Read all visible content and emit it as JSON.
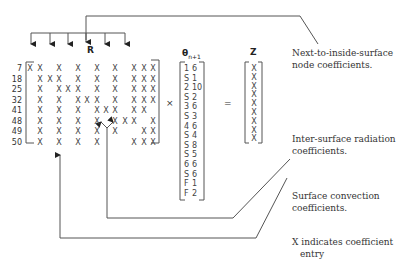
{
  "matrices": {
    "R": {
      "label": "R",
      "row_labels": [
        "7",
        "18",
        "25",
        "32",
        "41",
        "48",
        "49",
        "50"
      ],
      "columns_x": [
        30,
        40,
        50,
        59,
        68,
        78,
        87,
        97,
        106,
        115,
        125,
        134,
        144,
        153
      ],
      "rows": [
        [
          1,
          1,
          0,
          1,
          0,
          1,
          0,
          1,
          0,
          1,
          0,
          1,
          1,
          1
        ],
        [
          0,
          1,
          1,
          1,
          0,
          1,
          0,
          1,
          0,
          1,
          0,
          1,
          1,
          1
        ],
        [
          0,
          1,
          0,
          1,
          1,
          1,
          0,
          1,
          0,
          1,
          0,
          1,
          1,
          1
        ],
        [
          0,
          1,
          0,
          1,
          0,
          1,
          1,
          1,
          0,
          1,
          0,
          1,
          1,
          1
        ],
        [
          0,
          1,
          0,
          1,
          0,
          1,
          0,
          1,
          1,
          1,
          0,
          1,
          1,
          0
        ],
        [
          0,
          1,
          0,
          1,
          0,
          1,
          0,
          1,
          0,
          1,
          1,
          1,
          0,
          1
        ],
        [
          0,
          1,
          0,
          1,
          0,
          1,
          0,
          1,
          0,
          1,
          0,
          0,
          1,
          1
        ],
        [
          0,
          1,
          0,
          1,
          0,
          1,
          0,
          1,
          0,
          0,
          0,
          1,
          1,
          1
        ]
      ],
      "entry_glyph": "X"
    },
    "theta": {
      "label": "θ",
      "subscript": "n+1",
      "rows": [
        [
          "1",
          "6"
        ],
        [
          "S",
          "1"
        ],
        [
          "2",
          "10"
        ],
        [
          "S",
          "2"
        ],
        [
          "3",
          "6"
        ],
        [
          "S",
          "3"
        ],
        [
          "4",
          "6"
        ],
        [
          "S",
          "4"
        ],
        [
          "S",
          "8"
        ],
        [
          "S",
          "5"
        ],
        [
          "6",
          "6"
        ],
        [
          "S",
          "6"
        ],
        [
          "F",
          "1"
        ],
        [
          "F",
          "2"
        ]
      ]
    },
    "Z": {
      "label": "Z",
      "rows": [
        "X",
        "X",
        "X",
        "X",
        "X",
        "X",
        "X",
        "X",
        "X"
      ]
    }
  },
  "operators": {
    "multiply": "×",
    "equals": "="
  },
  "annotations": {
    "next_to_inside": [
      "Next-to-inside-surface",
      "node coefficients."
    ],
    "inter_surface": [
      "Inter-surface radiation",
      "coefficients."
    ],
    "surface_convection": [
      "Surface convection",
      "coefficients."
    ],
    "legend": [
      "X indicates coefficient",
      "entry"
    ]
  },
  "colors": {
    "line": "#555555",
    "text": "#333333",
    "background": "#ffffff"
  }
}
